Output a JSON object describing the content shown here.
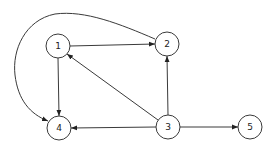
{
  "diagram": {
    "type": "directed-graph",
    "nodes": [
      {
        "id": "1",
        "label": "1",
        "x": 58,
        "y": 46
      },
      {
        "id": "2",
        "label": "2",
        "x": 167,
        "y": 44
      },
      {
        "id": "3",
        "label": "3",
        "x": 168,
        "y": 127
      },
      {
        "id": "4",
        "label": "4",
        "x": 59,
        "y": 128
      },
      {
        "id": "5",
        "label": "5",
        "x": 250,
        "y": 127
      }
    ],
    "edges": [
      {
        "from": "1",
        "to": "2",
        "shape": "straight"
      },
      {
        "from": "1",
        "to": "4",
        "shape": "straight"
      },
      {
        "from": "3",
        "to": "1",
        "shape": "straight"
      },
      {
        "from": "3",
        "to": "2",
        "shape": "straight"
      },
      {
        "from": "3",
        "to": "4",
        "shape": "straight"
      },
      {
        "from": "3",
        "to": "5",
        "shape": "straight"
      },
      {
        "from": "2",
        "to": "4",
        "shape": "curved"
      }
    ],
    "colors": {
      "stroke": "#3a3a3a",
      "background": "#ffffff",
      "text": "#222222"
    }
  }
}
